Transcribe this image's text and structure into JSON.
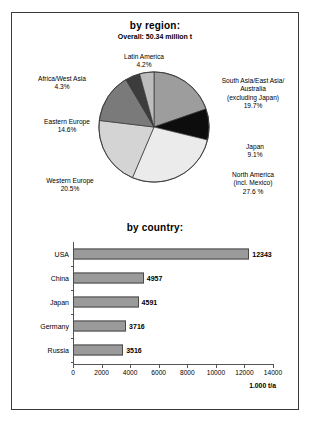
{
  "figure": {
    "frame_color": "#3a3a3a",
    "background": "#ffffff"
  },
  "chart_data": [
    {
      "type": "pie",
      "title": "by region:",
      "subtitle": "Overall: 50.34 million t",
      "unit": "%",
      "legend": "labels-outside",
      "categories": [
        "South Asia/East Asia/ Australia (excluding Japan)",
        "Japan",
        "North America (incl. Mexico)",
        "Western Europe",
        "Eastern Europe",
        "Africa/West Asia",
        "Latin America"
      ],
      "values": [
        19.7,
        9.1,
        27.6,
        20.5,
        14.6,
        4.3,
        4.2
      ],
      "slice_colors": [
        "#9d9d9d",
        "#0d0d0d",
        "#ebebeb",
        "#d4d4d4",
        "#7a7a7a",
        "#3c3c3c",
        "#bdbdbd"
      ],
      "labels": [
        {
          "id": "latin-america",
          "line1": "Latin America",
          "line2": "4.2%",
          "line3": "",
          "line4": ""
        },
        {
          "id": "south-asia",
          "line1": "South Asia/East Asia/",
          "line2": "Australia",
          "line3": "(excluding Japan)",
          "line4": "19.7%"
        },
        {
          "id": "japan",
          "line1": "Japan",
          "line2": "9.1%",
          "line3": "",
          "line4": ""
        },
        {
          "id": "north-america",
          "line1": "North America",
          "line2": "(incl. Mexico)",
          "line3": "27.6 %",
          "line4": ""
        },
        {
          "id": "western-europe",
          "line1": "Western Europe",
          "line2": "20.5%",
          "line3": "",
          "line4": ""
        },
        {
          "id": "eastern-europe",
          "line1": "Eastern Europe",
          "line2": "14.6%",
          "line3": "",
          "line4": ""
        },
        {
          "id": "africa-west-asia",
          "line1": "Africa/West Asia",
          "line2": "4.3%",
          "line3": "",
          "line4": ""
        }
      ]
    },
    {
      "type": "bar",
      "orientation": "horizontal",
      "title": "by country:",
      "categories": [
        "USA",
        "China",
        "Japan",
        "Germany",
        "Russia"
      ],
      "values": [
        12343,
        4957,
        4591,
        3716,
        3516
      ],
      "value_labels": [
        "12343",
        "4957",
        "4591",
        "3716",
        "3516"
      ],
      "xlabel": "1.000 t/a",
      "ylabel": "",
      "xlim": [
        0,
        14000
      ],
      "xticks": [
        0,
        2000,
        4000,
        6000,
        8000,
        10000,
        12000,
        14000
      ],
      "xtick_labels": [
        "0",
        "2000",
        "4000",
        "6000",
        "8000",
        "10000",
        "12000",
        "14000"
      ],
      "grid": false,
      "bar_color": "#9a9a9a",
      "bar_border_color": "#4a4a4a"
    }
  ]
}
